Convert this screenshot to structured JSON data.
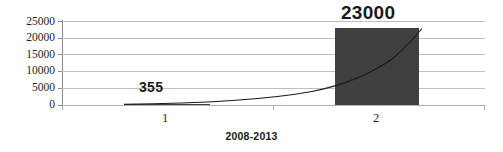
{
  "chart_data": {
    "type": "bar",
    "title": "",
    "xlabel": "2008-2013",
    "ylabel": "",
    "categories": [
      "1",
      "2"
    ],
    "values": [
      355,
      23000
    ],
    "data_labels": [
      "355",
      "23000"
    ],
    "ylim": [
      0,
      25000
    ],
    "ytick_labels": [
      "0",
      "5000",
      "10000",
      "15000",
      "20000",
      "25000"
    ],
    "ytick_values": [
      0,
      5000,
      10000,
      15000,
      20000,
      25000
    ],
    "grid": true,
    "legend": "none",
    "series": [
      {
        "name": "2008-2013",
        "values": [
          355,
          23000
        ]
      }
    ],
    "trendline": {
      "type": "exponential",
      "visible": true
    },
    "colors": {
      "bar": "#404040",
      "gridline": "#bfbfbf",
      "axis": "#8a8a8a",
      "text": "#231f20",
      "trendline": "#1a1a1a",
      "background": "#ffffff"
    }
  }
}
